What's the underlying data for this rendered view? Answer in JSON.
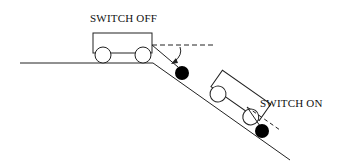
{
  "diagram": {
    "labels": {
      "switch_off": "SWITCH OFF",
      "switch_on": "SWITCH ON"
    },
    "colors": {
      "line": "#222222",
      "ball": "#000000",
      "background": "#ffffff"
    },
    "elements": [
      {
        "name": "ground",
        "description": "flat ground transitioning to downward slope"
      },
      {
        "name": "cart-off",
        "description": "cart on flat ground with switch off"
      },
      {
        "name": "cart-on",
        "description": "cart tilted on slope with switch on"
      },
      {
        "name": "ball-off",
        "description": "pendulum ball deflected, switch off"
      },
      {
        "name": "ball-on",
        "description": "pendulum ball hanging, switch on"
      }
    ]
  }
}
